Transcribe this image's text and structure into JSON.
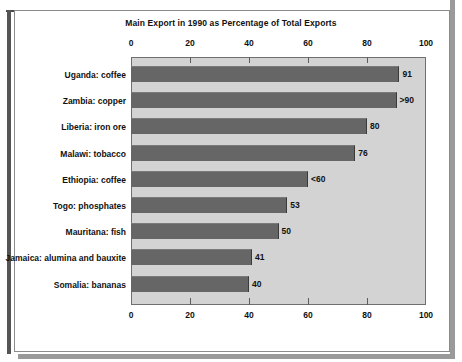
{
  "chart_data": {
    "type": "bar",
    "orientation": "horizontal",
    "title": "Main Export in 1990 as Percentage of Total Exports",
    "xlabel": "",
    "ylabel": "",
    "xlim": [
      0,
      100
    ],
    "xticks": [
      0,
      20,
      40,
      60,
      80,
      100
    ],
    "xtick_labels": [
      "0",
      "20",
      "40",
      "60",
      "80",
      "100"
    ],
    "grid": false,
    "legend": null,
    "axis_top": true,
    "axis_bottom": true,
    "plot_background": "#d3d3d3",
    "bar_color": "#666666",
    "categories": [
      "Uganda: coffee",
      "Zambia: copper",
      "Liberia: iron ore",
      "Malawi: tobacco",
      "Ethiopia: coffee",
      "Togo: phosphates",
      "Mauritana: fish",
      "Jamaica: alumina and bauxite",
      "Somalia: bananas"
    ],
    "values": [
      91,
      90,
      80,
      76,
      60,
      53,
      50,
      41,
      40
    ],
    "value_labels": [
      "91",
      ">90",
      "80",
      "76",
      "<60",
      "53",
      "50",
      "41",
      "40"
    ]
  }
}
